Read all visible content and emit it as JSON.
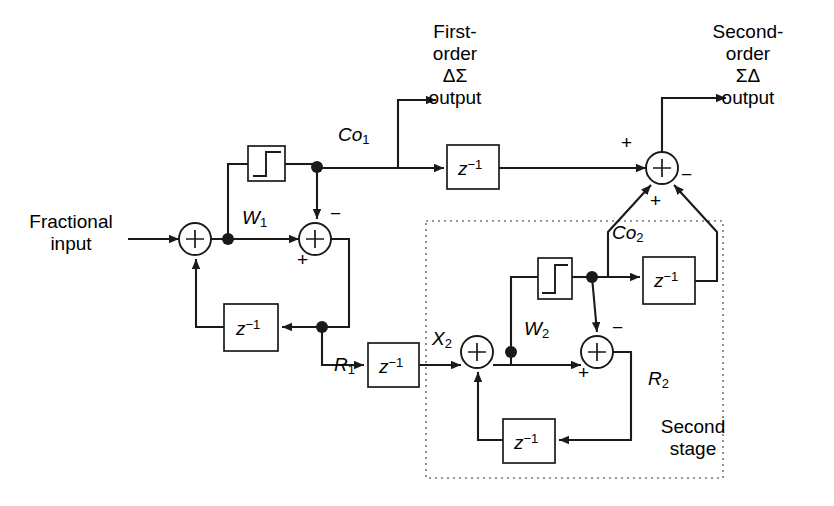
{
  "figure": {
    "type": "block-diagram",
    "stroke_color": "#1a1a1a",
    "background": "#ffffff"
  },
  "labels": {
    "fractional_input": "Fractional\ninput",
    "first_order_output": "First-\norder\nΔΣ\noutput",
    "second_order_output": "Second-\norder\nΣΔ\noutput",
    "second_stage": "Second\nstage",
    "w1": "W",
    "w1_sub": "1",
    "w2": "W",
    "w2_sub": "2",
    "r1": "R",
    "r1_sub": "1",
    "r2": "R",
    "r2_sub": "2",
    "x2": "X",
    "x2_sub": "2",
    "co1": "Co",
    "co1_sub": "1",
    "co2": "Co",
    "co2_sub": "2",
    "delay": "z",
    "delay_sup": "−1"
  },
  "signs": {
    "sum1_feedback": "",
    "sum2_top": "−",
    "sum2_bottom": "+",
    "sum3_left": "+",
    "sum3_bottom": "+",
    "sum3_right": "−",
    "sum4_top": "−",
    "sum4_bottom": "+"
  },
  "blocks": [
    {
      "name": "quantizer-1",
      "kind": "quantizer",
      "x": 248,
      "y": 146,
      "w": 37,
      "h": 35
    },
    {
      "name": "delay-feedback-1",
      "kind": "delay",
      "x": 224,
      "y": 304,
      "w": 54,
      "h": 47
    },
    {
      "name": "delay-r1",
      "kind": "delay",
      "x": 368,
      "y": 343,
      "w": 51,
      "h": 44
    },
    {
      "name": "delay-co1",
      "kind": "delay",
      "x": 447,
      "y": 145,
      "w": 52,
      "h": 44
    },
    {
      "name": "quantizer-2",
      "kind": "quantizer",
      "x": 538,
      "y": 258,
      "w": 34,
      "h": 41
    },
    {
      "name": "delay-co2",
      "kind": "delay",
      "x": 643,
      "y": 257,
      "w": 52,
      "h": 47
    },
    {
      "name": "delay-feedback-2",
      "kind": "delay",
      "x": 503,
      "y": 419,
      "w": 52,
      "h": 44
    }
  ],
  "summers": [
    {
      "name": "summer-1",
      "cx": 195,
      "cy": 239,
      "r": 16
    },
    {
      "name": "summer-2",
      "cx": 315,
      "cy": 239,
      "r": 16
    },
    {
      "name": "summer-3",
      "cx": 662,
      "cy": 168,
      "r": 16
    },
    {
      "name": "summer-4",
      "cx": 477,
      "cy": 352,
      "r": 16
    },
    {
      "name": "summer-5",
      "cx": 597,
      "cy": 352,
      "r": 16
    }
  ],
  "nodes": [
    {
      "name": "node-w1",
      "cx": 228,
      "cy": 239
    },
    {
      "name": "node-co1",
      "cx": 317,
      "cy": 168
    },
    {
      "name": "node-r1",
      "cx": 322,
      "cy": 327
    },
    {
      "name": "node-w2",
      "cx": 511,
      "cy": 352
    },
    {
      "name": "node-co2",
      "cx": 592,
      "cy": 278
    }
  ],
  "second_stage_boundary": {
    "x": 426,
    "y": 221,
    "w": 297,
    "h": 257,
    "style": "dotted"
  }
}
